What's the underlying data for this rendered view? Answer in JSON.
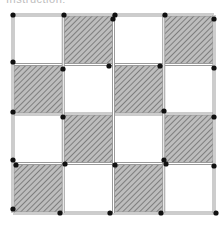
{
  "caption": {
    "text": "Instruction:"
  },
  "board": {
    "rows": 4,
    "cols": 4,
    "origin": [
      13,
      15
    ],
    "cell_size": [
      50.25,
      49.5
    ],
    "colors": {
      "hatch_fill": "#bdbdbd",
      "hatch_line": "#6e6e6e",
      "edge": "#9a9a9a",
      "edge_inner": "#ffffff",
      "dot": "#111111"
    },
    "shaded": [
      [
        0,
        1,
        0,
        1
      ],
      [
        1,
        0,
        1,
        0
      ],
      [
        0,
        1,
        0,
        1
      ],
      [
        1,
        0,
        1,
        0
      ]
    ],
    "dots": [
      [
        13,
        15
      ],
      [
        64,
        15
      ],
      [
        115,
        15
      ],
      [
        113,
        19
      ],
      [
        165,
        15
      ],
      [
        214,
        19
      ],
      [
        13,
        62
      ],
      [
        63,
        69
      ],
      [
        109,
        66
      ],
      [
        160,
        66
      ],
      [
        214,
        68
      ],
      [
        13,
        112
      ],
      [
        63,
        117
      ],
      [
        164,
        111
      ],
      [
        214,
        117
      ],
      [
        13,
        160
      ],
      [
        16,
        165
      ],
      [
        65,
        164
      ],
      [
        115,
        165
      ],
      [
        164,
        160
      ],
      [
        166,
        164
      ],
      [
        214,
        166
      ],
      [
        13,
        209
      ],
      [
        60,
        213
      ],
      [
        110,
        213
      ],
      [
        161,
        213
      ],
      [
        216,
        213
      ]
    ]
  }
}
